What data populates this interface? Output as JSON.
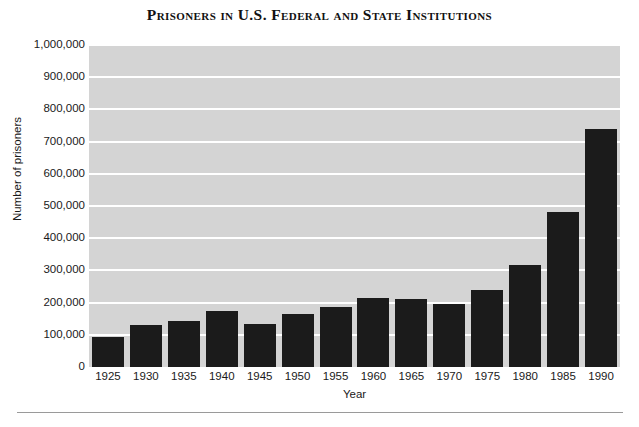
{
  "chart_data": {
    "type": "bar",
    "title": "Prisoners in U.S. Federal and State Institutions",
    "xlabel": "Year",
    "ylabel": "Number of prisoners",
    "categories": [
      "1925",
      "1930",
      "1935",
      "1940",
      "1945",
      "1950",
      "1955",
      "1960",
      "1965",
      "1970",
      "1975",
      "1980",
      "1985",
      "1990"
    ],
    "values": [
      92000,
      129000,
      144000,
      173000,
      135000,
      166000,
      185000,
      213000,
      211000,
      196000,
      240000,
      316000,
      481000,
      740000
    ],
    "ylim": [
      0,
      1000000
    ],
    "ytick_values": [
      0,
      100000,
      200000,
      300000,
      400000,
      500000,
      600000,
      700000,
      800000,
      900000,
      1000000
    ],
    "ytick_labels": [
      "0",
      "100,000",
      "200,000",
      "300,000",
      "400,000",
      "500,000",
      "600,000",
      "700,000",
      "800,000",
      "900,000",
      "1,000,000"
    ],
    "grid": true,
    "grid_color": "#ffffff",
    "plot_background": "#d4d4d4",
    "bar_color": "#1b1b1b",
    "legend": null,
    "legend_position": "none"
  }
}
